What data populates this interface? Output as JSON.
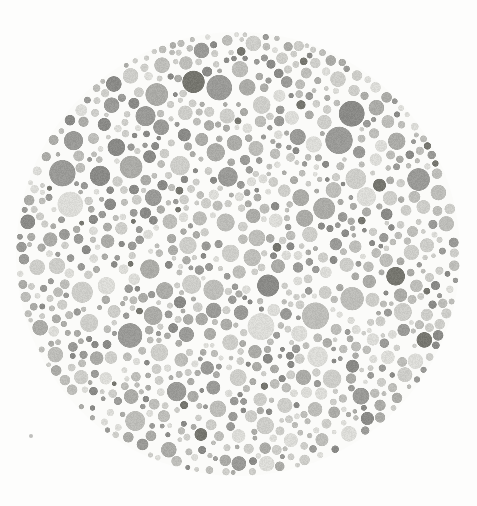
{
  "image": {
    "kind": "ishihara-plate",
    "title": "Ishihara color vision test plate (grayscale)",
    "description": "A circular mosaic of densely packed dots of varying sizes and gray tones on an off-white background.",
    "width": 477,
    "height": 506,
    "background_color": "#fdfdfc"
  },
  "plate": {
    "center_x": 238,
    "center_y": 254,
    "radius": 222,
    "dot_count": 960,
    "dot_radius_min": 2.0,
    "dot_radius_max": 14.0,
    "edge_softness_px": 1.0,
    "texture_noise": true
  },
  "palette": {
    "swatches": [
      {
        "name": "dot-very-light",
        "hex": "#dcdcd8",
        "weight": 0.14
      },
      {
        "name": "dot-light",
        "hex": "#cdcdc9",
        "weight": 0.21
      },
      {
        "name": "dot-mid-light",
        "hex": "#bdbdb9",
        "weight": 0.19
      },
      {
        "name": "dot-mid",
        "hex": "#ababa7",
        "weight": 0.18
      },
      {
        "name": "dot-mid-dark",
        "hex": "#9a9a97",
        "weight": 0.15
      },
      {
        "name": "dot-dark",
        "hex": "#8a8a87",
        "weight": 0.1
      },
      {
        "name": "dot-very-dark",
        "hex": "#76766f",
        "weight": 0.03
      }
    ],
    "background": "#fdfdfc",
    "gap_color": "#fbfbf9"
  },
  "artifacts": [
    {
      "name": "scan-speck",
      "x": 31,
      "y": 436,
      "r": 2.4,
      "hex": "#bfbfbc"
    }
  ],
  "render": {
    "seed": 20240517,
    "packing": "poisson-dart-throw",
    "attempts": 48000,
    "min_gap_px": 1.2
  }
}
